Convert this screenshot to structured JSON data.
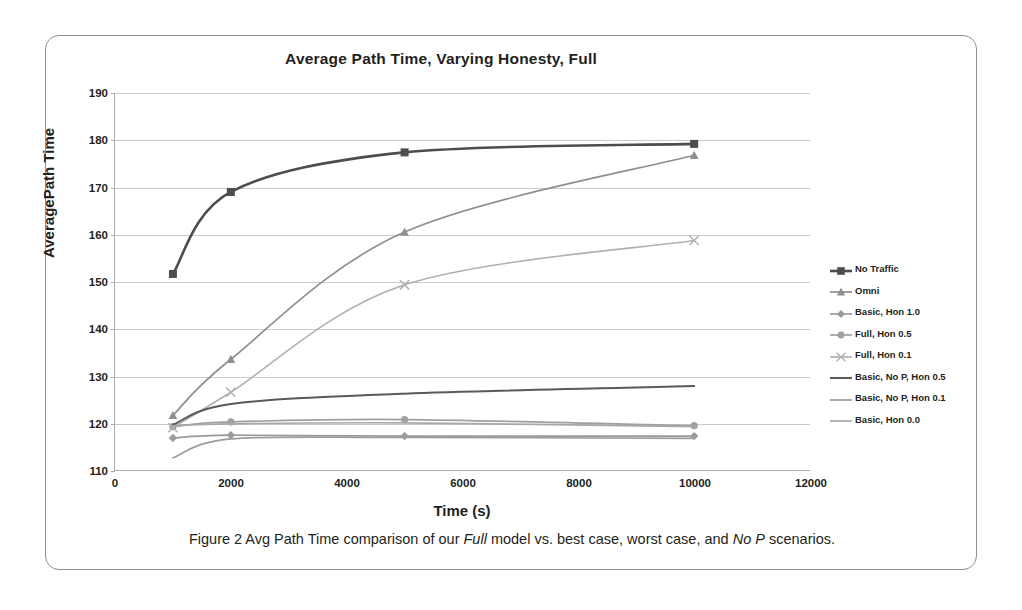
{
  "figure": {
    "caption_parts": {
      "p1": "Figure 2 Avg Path Time comparison of our ",
      "em1": "Full",
      "p2": " model vs. best case, worst case, and ",
      "em2": "No P",
      "p3": " scenarios."
    }
  },
  "chart_data": {
    "type": "line",
    "title": "Average Path Time, Varying Honesty, Full",
    "xlabel": "Time (s)",
    "ylabel": "AveragePath Time",
    "xlim": [
      0,
      12000
    ],
    "ylim": [
      110,
      190
    ],
    "xticks": [
      0,
      2000,
      4000,
      6000,
      8000,
      10000,
      12000
    ],
    "yticks": [
      110,
      120,
      130,
      140,
      150,
      160,
      170,
      180,
      190
    ],
    "grid": "horizontal",
    "legend_position": "right",
    "x": [
      1000,
      2000,
      5000,
      10000
    ],
    "series": [
      {
        "name": "No Traffic",
        "marker": "square",
        "color": "#4d4d4d",
        "width": 2.6,
        "values": [
          151.6,
          169.0,
          177.4,
          179.2
        ]
      },
      {
        "name": "Omni",
        "marker": "triangle",
        "color": "#8f8f8f",
        "width": 1.7,
        "values": [
          121.6,
          133.5,
          160.5,
          176.8
        ]
      },
      {
        "name": "Basic, Hon 1.0",
        "marker": "diamond",
        "color": "#9a9a9a",
        "width": 1.7,
        "values": [
          116.8,
          117.4,
          117.2,
          117.2
        ]
      },
      {
        "name": "Full, Hon 0.5",
        "marker": "circle",
        "color": "#a0a0a0",
        "width": 1.7,
        "values": [
          119.2,
          120.2,
          120.7,
          119.4
        ]
      },
      {
        "name": "Full, Hon 0.1",
        "marker": "cross",
        "color": "#b0b0b0",
        "width": 1.6,
        "values": [
          119.0,
          126.5,
          149.3,
          158.7
        ]
      },
      {
        "name": "Basic, No P, Hon 0.5",
        "marker": "none",
        "color": "#5a5a5a",
        "width": 2.0,
        "values": [
          119.6,
          124.0,
          126.2,
          127.8
        ]
      },
      {
        "name": "Basic, No P, Hon 0.1",
        "marker": "none",
        "color": "#9c9c9c",
        "width": 1.7,
        "values": [
          112.6,
          116.6,
          116.9,
          116.7
        ]
      },
      {
        "name": "Basic, Hon 0.0",
        "marker": "none",
        "color": "#a8a8a8",
        "width": 1.7,
        "values": [
          119.4,
          119.8,
          120.0,
          119.2
        ]
      }
    ]
  }
}
